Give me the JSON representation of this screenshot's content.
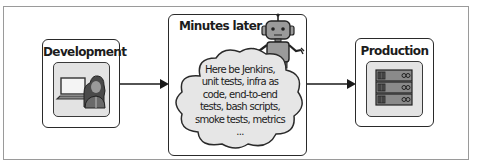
{
  "diagram": {
    "stages": [
      {
        "id": "development",
        "label": "Development",
        "icon": "developer-laptop-icon"
      },
      {
        "id": "pipeline",
        "label": "Minutes later",
        "icon": "robot-icon"
      },
      {
        "id": "production",
        "label": "Production",
        "icon": "server-rack-icon"
      }
    ],
    "cloud": {
      "lines": [
        "Here be Jenkins,",
        "unit tests, infra as",
        "code, end-to-end",
        "tests, bash scripts,",
        "smoke tests, metrics",
        "..."
      ]
    },
    "arrows": [
      {
        "from": "development",
        "to": "pipeline"
      },
      {
        "from": "pipeline",
        "to": "production"
      }
    ],
    "colors": {
      "border": "#2a2a2a",
      "tile_fill": "#e3e3e3",
      "cloud_fill": "#e6e6e6",
      "icon_dark": "#5a5a5a",
      "icon_mid": "#8a8a8a"
    }
  }
}
